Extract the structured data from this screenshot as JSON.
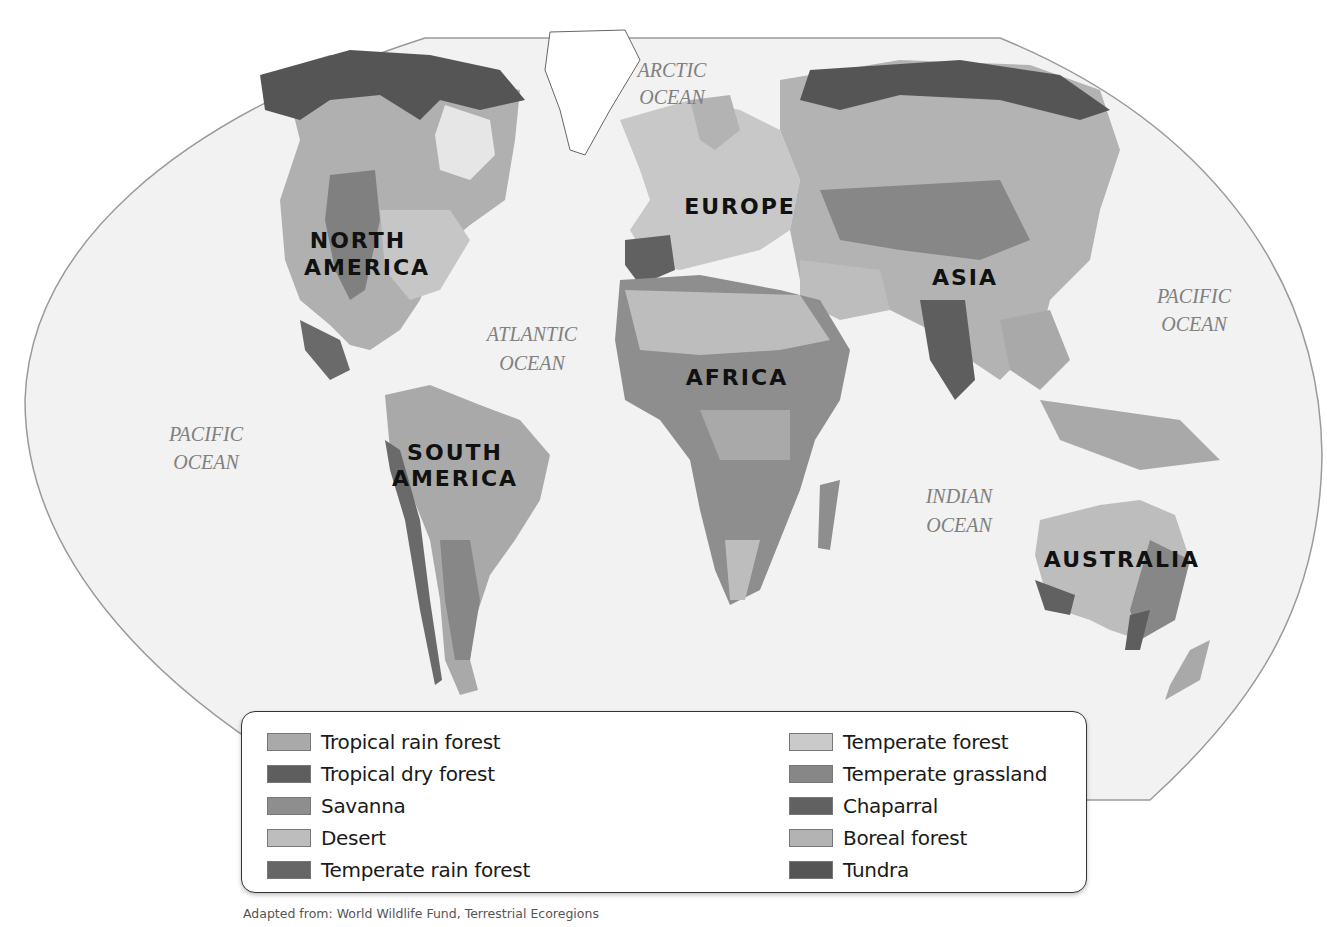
{
  "map": {
    "title": "World Biomes",
    "continents": [
      {
        "id": "north-america",
        "lines": [
          "NORTH",
          "AMERICA"
        ],
        "x": 358,
        "y": 248
      },
      {
        "id": "south-america",
        "lines": [
          "SOUTH",
          "AMERICA"
        ],
        "x": 455,
        "y": 460
      },
      {
        "id": "europe",
        "lines": [
          "EUROPE"
        ],
        "x": 740,
        "y": 214
      },
      {
        "id": "africa",
        "lines": [
          "AFRICA"
        ],
        "x": 737,
        "y": 385
      },
      {
        "id": "asia",
        "lines": [
          "ASIA"
        ],
        "x": 965,
        "y": 285
      },
      {
        "id": "australia",
        "lines": [
          "AUSTRALIA"
        ],
        "x": 1122,
        "y": 567
      }
    ],
    "oceans": [
      {
        "id": "arctic-ocean",
        "lines": [
          "ARCTIC",
          "OCEAN"
        ],
        "x": 672,
        "y": 98
      },
      {
        "id": "atlantic-ocean",
        "lines": [
          "ATLANTIC",
          "OCEAN"
        ],
        "x": 532,
        "y": 340
      },
      {
        "id": "pacific-ocean-west",
        "lines": [
          "PACIFIC",
          "OCEAN"
        ],
        "x": 206,
        "y": 440
      },
      {
        "id": "pacific-ocean-east",
        "lines": [
          "PACIFIC",
          "OCEAN"
        ],
        "x": 1194,
        "y": 303
      },
      {
        "id": "indian-ocean",
        "lines": [
          "INDIAN",
          "OCEAN"
        ],
        "x": 959,
        "y": 503
      }
    ]
  },
  "legend": {
    "left": [
      {
        "label": "Tropical rain forest",
        "color": "#a9a9a9"
      },
      {
        "label": "Tropical dry forest",
        "color": "#5e5e5e"
      },
      {
        "label": "Savanna",
        "color": "#8e8e8e"
      },
      {
        "label": "Desert",
        "color": "#bdbdbd"
      },
      {
        "label": "Temperate rain forest",
        "color": "#666666"
      }
    ],
    "right": [
      {
        "label": "Temperate forest",
        "color": "#cacaca"
      },
      {
        "label": "Temperate grassland",
        "color": "#878787"
      },
      {
        "label": "Chaparral",
        "color": "#616161"
      },
      {
        "label": "Boreal forest",
        "color": "#b3b3b3"
      },
      {
        "label": "Tundra",
        "color": "#555555"
      }
    ]
  },
  "source": "Adapted from: World Wildlife Fund, Terrestrial Ecoregions",
  "colors": {
    "ocean": "#f2f2f2",
    "frame_border": "#9a9a9a",
    "greenland_ice": "#ffffff",
    "border_lines": "#222222"
  }
}
